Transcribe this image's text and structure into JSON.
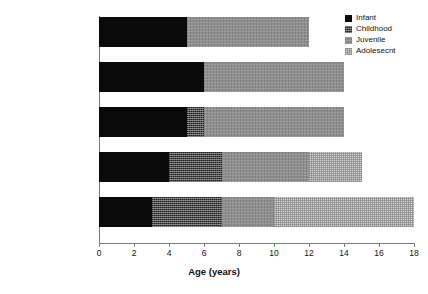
{
  "chart_data": {
    "type": "bar",
    "orientation": "horizontal",
    "stacked": true,
    "title": "",
    "xlabel": "Age (years)",
    "ylabel": "",
    "xlim": [
      0,
      18
    ],
    "xticks": [
      0,
      2,
      4,
      6,
      8,
      10,
      12,
      14,
      16,
      18
    ],
    "xtick_labels": [
      "0",
      "2",
      "4",
      "6",
      "8",
      "10",
      "12",
      "14",
      "16",
      "18"
    ],
    "grid": false,
    "legend_position": "top-right",
    "categories": [
      "Chimpanzee",
      "A. africanus",
      "Early Homo",
      "Late Homo erectus",
      "Homo sapiens"
    ],
    "series": [
      {
        "name": "Infant",
        "values": [
          5,
          6,
          5,
          4,
          3
        ]
      },
      {
        "name": "Childhood",
        "values": [
          0,
          0,
          1,
          3,
          4
        ]
      },
      {
        "name": "Juvenile",
        "values": [
          7,
          8,
          8,
          5,
          3
        ]
      },
      {
        "name": "Adolesecnt",
        "values": [
          0,
          0,
          0,
          3,
          8
        ]
      }
    ],
    "totals": [
      12,
      14,
      14,
      15,
      18
    ],
    "colors": {
      "Infant": "#0a0a0a",
      "Childhood": "#4a4a4a",
      "Juvenile": "#8e8e8e",
      "Adolesecnt": "#d2d2d2"
    }
  },
  "legend": {
    "items": [
      {
        "label": "Infant",
        "swatch": "pat-infant"
      },
      {
        "label": "Childhood",
        "swatch": "pat-childhood"
      },
      {
        "label": "Juvenile",
        "swatch": "pat-juvenile"
      },
      {
        "label": "Adolesecnt",
        "swatch": "pat-adolescent"
      }
    ]
  },
  "axis": {
    "x_title": "Age (years)"
  }
}
